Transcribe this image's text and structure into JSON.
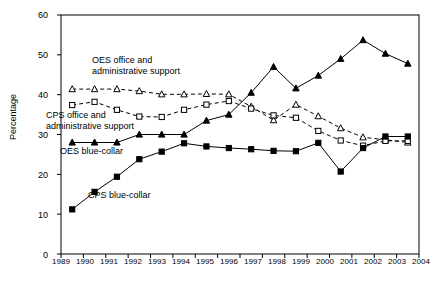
{
  "chart_data": {
    "type": "line",
    "title": "",
    "xlabel": "",
    "ylabel": "Percentage",
    "x": [
      1989,
      1990,
      1991,
      1992,
      1993,
      1994,
      1995,
      1996,
      1997,
      1998,
      1999,
      2000,
      2001,
      2002,
      2003,
      2004
    ],
    "xtick_labels": [
      "1989",
      "1990",
      "1991",
      "1992",
      "1993",
      "1994",
      "1995",
      "1996",
      "1997",
      "1998",
      "1999",
      "2000",
      "2001",
      "2002",
      "2003",
      "2004"
    ],
    "ytick_labels": [
      "0",
      "10",
      "20",
      "30",
      "40",
      "50",
      "60"
    ],
    "yticks": [
      0,
      10,
      20,
      30,
      40,
      50,
      60
    ],
    "ylim": [
      0,
      60
    ],
    "grid": false,
    "legend_position": "inline-annotations",
    "series": [
      {
        "name": "OES office and administrative support",
        "marker": "open-triangle",
        "line_style": "dashed",
        "color": "#000000",
        "values": [
          41.4,
          41.4,
          41.4,
          40.9,
          40.1,
          40.1,
          40.2,
          40.1,
          37.0,
          33.6,
          37.5,
          34.6,
          31.6,
          29.3,
          28.7,
          28.0
        ]
      },
      {
        "name": "CPS office and administrative support",
        "marker": "open-square",
        "line_style": "dashed",
        "color": "#000000",
        "values": [
          37.4,
          38.2,
          36.2,
          34.5,
          34.4,
          36.2,
          37.5,
          38.4,
          36.5,
          34.8,
          34.2,
          30.9,
          28.5,
          27.2,
          28.4,
          28.4
        ]
      },
      {
        "name": "OES blue-collar",
        "marker": "filled-triangle",
        "line_style": "solid",
        "color": "#000000",
        "values": [
          28.0,
          28.0,
          28.0,
          30.0,
          30.0,
          30.0,
          33.5,
          35.0,
          40.5,
          47.0,
          41.6,
          44.8,
          49.0,
          53.7,
          50.3,
          47.8
        ]
      },
      {
        "name": "CPS blue-collar",
        "marker": "filled-square",
        "line_style": "solid",
        "color": "#000000",
        "values": [
          11.2,
          15.6,
          19.4,
          23.8,
          25.7,
          27.8,
          27.0,
          26.6,
          26.3,
          25.9,
          25.8,
          27.9,
          20.7,
          26.6,
          29.5,
          29.5
        ]
      }
    ],
    "annotations": [
      {
        "id": "oes-office-annotation",
        "text_line1": "OES office and",
        "text_line2": "administrative support",
        "x": 92,
        "y": 55
      },
      {
        "id": "cps-office-annotation",
        "text_line1": "CPS office and",
        "text_line2": "administrative support",
        "x": 46,
        "y": 110
      },
      {
        "id": "oes-blue-collar-annotation",
        "text_line1": "OES blue-collar",
        "text_line2": "",
        "x": 60,
        "y": 146
      },
      {
        "id": "cps-blue-collar-annotation",
        "text_line1": "CPS blue-collar",
        "text_line2": "",
        "x": 88,
        "y": 190
      }
    ]
  }
}
